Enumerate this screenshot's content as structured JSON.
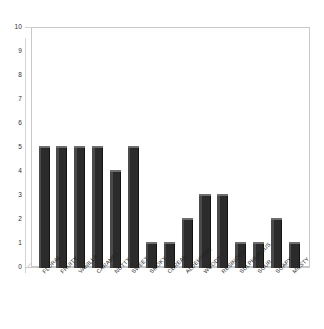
{
  "chart": {
    "type": "bar",
    "axis": {
      "y_label": "",
      "x_label": "",
      "y_ticks": [
        "0",
        "1",
        "2",
        "3",
        "4",
        "5",
        "6",
        "7",
        "8",
        "9",
        "10"
      ]
    },
    "colors": {
      "bar_fill": "#2b2b2b",
      "bar_left_face": "#4a4a4a",
      "bar_top_face": "#6e6e6e",
      "frame": "#c9c9c9",
      "tick_text": "#2f2f2f",
      "label_text": "#1f1f1f",
      "background": "#ffffff"
    }
  },
  "chart_data": {
    "type": "bar",
    "title": "",
    "xlabel": "",
    "ylabel": "",
    "ylim": [
      0,
      10
    ],
    "grid": false,
    "legend": "none",
    "categories": [
      "FLORAL",
      "FRUITY",
      "VANILLA",
      "CARAMEL",
      "NUTTY",
      "SWEET",
      "SMOKY",
      "CEREAL",
      "ALDEHYDIC",
      "WOODY",
      "RESINOUS",
      "SULPHUROUS",
      "SOUR",
      "SOAPY",
      "MUSTY"
    ],
    "values": [
      5,
      5,
      5,
      5,
      4,
      5,
      1,
      1,
      2,
      3,
      3,
      1,
      1,
      2,
      1
    ],
    "tick_labels_y": [
      "0",
      "1",
      "2",
      "3",
      "4",
      "5",
      "6",
      "7",
      "8",
      "9",
      "10"
    ]
  }
}
